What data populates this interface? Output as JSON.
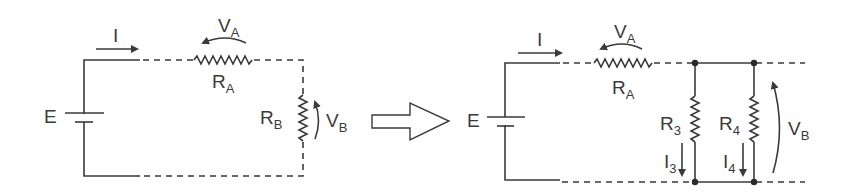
{
  "diagram": {
    "type": "circuit-transformation",
    "left_circuit": {
      "source_label": "E",
      "current_label": "I",
      "resistor_a": {
        "label": "R",
        "sub": "A"
      },
      "voltage_a": {
        "label": "V",
        "sub": "A"
      },
      "resistor_b": {
        "label": "R",
        "sub": "B"
      },
      "voltage_b": {
        "label": "V",
        "sub": "B"
      }
    },
    "transform_arrow": "block-right-arrow",
    "right_circuit": {
      "source_label": "E",
      "current_label": "I",
      "resistor_a": {
        "label": "R",
        "sub": "A"
      },
      "voltage_a": {
        "label": "V",
        "sub": "A"
      },
      "resistor_3": {
        "label": "R",
        "sub": "3"
      },
      "resistor_4": {
        "label": "R",
        "sub": "4"
      },
      "current_3": {
        "label": "I",
        "sub": "3"
      },
      "current_4": {
        "label": "I",
        "sub": "4"
      },
      "voltage_b": {
        "label": "V",
        "sub": "B"
      }
    },
    "colors": {
      "line": "#3a3a3a",
      "background": "#ffffff"
    }
  }
}
